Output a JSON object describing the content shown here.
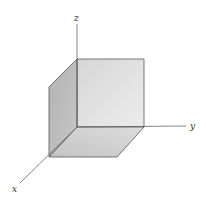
{
  "diagram": {
    "axes": {
      "x": {
        "label": "x"
      },
      "y": {
        "label": "y"
      },
      "z": {
        "label": "z"
      }
    },
    "faces": [
      {
        "name": "yz-plane face",
        "fill": "#dedede"
      },
      {
        "name": "xz-plane face",
        "fill": "#b9b9b9"
      },
      {
        "name": "xy-plane face",
        "fill": "#cfcfcf"
      }
    ],
    "colors": {
      "edge": "#555555",
      "axis": "#666666"
    }
  }
}
